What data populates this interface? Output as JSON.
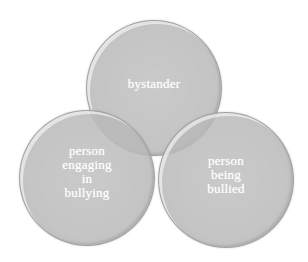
{
  "diagram": {
    "type": "venn",
    "circles": [
      {
        "id": "top",
        "label": "bystander"
      },
      {
        "id": "left",
        "label": "person\nengaging\nin\nbullying"
      },
      {
        "id": "right",
        "label": "person\nbeing\nbullied"
      }
    ],
    "colors": {
      "circle_fill": "#bcbcbc",
      "circle_border": "#969696",
      "label_text": "#ffffff",
      "background": "#ffffff"
    }
  }
}
